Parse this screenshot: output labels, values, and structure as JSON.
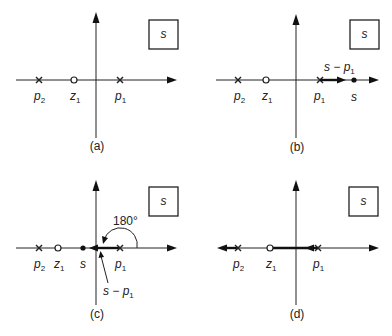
{
  "figure": {
    "plane_label": "s",
    "panels": [
      {
        "id": "a",
        "caption": "(a)",
        "labels": {
          "p2": "p",
          "p2_sub": "2",
          "z1": "z",
          "z1_sub": "1",
          "p1": "p",
          "p1_sub": "1"
        }
      },
      {
        "id": "b",
        "caption": "(b)",
        "labels": {
          "p2": "p",
          "p2_sub": "2",
          "z1": "z",
          "z1_sub": "1",
          "p1": "p",
          "p1_sub": "1",
          "s": "s",
          "vector": "s − p",
          "vector_sub": "1"
        }
      },
      {
        "id": "c",
        "caption": "(c)",
        "labels": {
          "p2": "p",
          "p2_sub": "2",
          "z1": "z",
          "z1_sub": "1",
          "p1": "p",
          "p1_sub": "1",
          "s": "s",
          "vector": "s − p",
          "vector_sub": "1",
          "angle": "180°"
        }
      },
      {
        "id": "d",
        "caption": "(d)",
        "labels": {
          "p2": "p",
          "p2_sub": "2",
          "z1": "z",
          "z1_sub": "1",
          "p1": "p",
          "p1_sub": "1"
        }
      }
    ]
  }
}
